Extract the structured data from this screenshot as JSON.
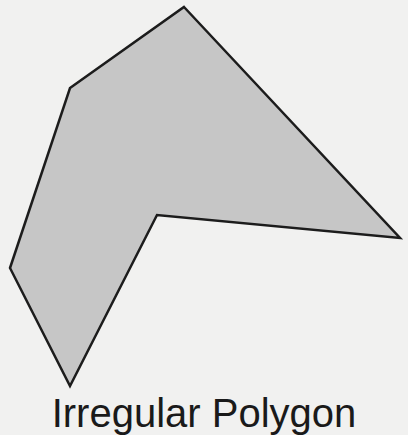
{
  "figure": {
    "shape": "concave hexagon",
    "vertex_count": 6,
    "fill_color": "#c6c6c6",
    "stroke_color": "#1c1c1c",
    "background_color": "#f1f1f0"
  },
  "caption": {
    "text": "Irregular Polygon",
    "visibility": "cropped at bottom edge; only top portions of glyphs visible"
  }
}
